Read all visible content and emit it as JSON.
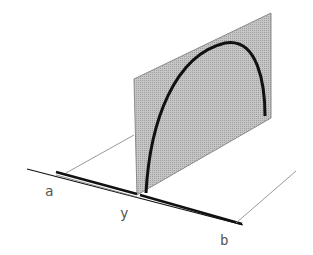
{
  "diagram": {
    "labels": {
      "a": "a",
      "y": "y",
      "b": "b"
    },
    "colors": {
      "panel_fill": "#bdbdbd",
      "panel_edge": "#8a8a8a",
      "arc": "#111111",
      "axis": "#111111",
      "guide": "#9a9a9a",
      "label": "#555555"
    }
  }
}
